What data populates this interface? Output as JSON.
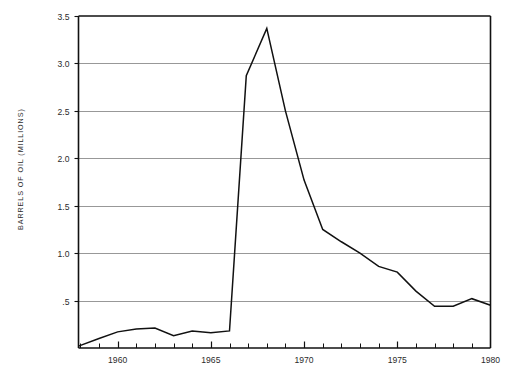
{
  "chart_data": {
    "type": "line",
    "title": "",
    "subtitle": "",
    "xlabel": "",
    "ylabel": "BARRELS OF OIL (MILLIONS)",
    "xlim": [
      1957.9,
      1980
    ],
    "ylim": [
      0,
      3.5
    ],
    "grid": true,
    "grid_axis": "y",
    "legend": false,
    "legend_position": "none",
    "x_tick_labels": [
      "1960",
      "1965",
      "1970",
      "1975",
      "1980"
    ],
    "x_tick_values": [
      1960,
      1965,
      1970,
      1975,
      1980
    ],
    "x_minor_tick_interval": 1,
    "y_tick_labels": [
      "3.5",
      "3.0",
      "2.5",
      "2.0",
      "1.5",
      "1.0",
      ".5"
    ],
    "y_tick_values": [
      3.5,
      3.0,
      2.5,
      2.0,
      1.5,
      1.0,
      0.5
    ],
    "series": [
      {
        "name": "Barrels of oil",
        "color": "#111111",
        "x": [
          1957.9,
          1959,
          1960,
          1961,
          1962,
          1963,
          1964,
          1965,
          1966,
          1966.9,
          1968,
          1969,
          1970,
          1971,
          1972,
          1973,
          1974,
          1975,
          1976,
          1977,
          1978,
          1979,
          1980
        ],
        "values": [
          0.02,
          0.1,
          0.17,
          0.2,
          0.21,
          0.13,
          0.18,
          0.16,
          0.18,
          2.87,
          3.37,
          2.5,
          1.77,
          1.25,
          1.12,
          1.0,
          0.86,
          0.8,
          0.6,
          0.44,
          0.44,
          0.52,
          0.45
        ]
      }
    ]
  },
  "axes": {
    "y_axis_title": "BARRELS OF OIL (MILLIONS)"
  },
  "colors": {
    "line": "#111111",
    "grid": "#8c8c8c",
    "frame": "#111111",
    "background": "#ffffff",
    "text": "#2b2b2b"
  }
}
